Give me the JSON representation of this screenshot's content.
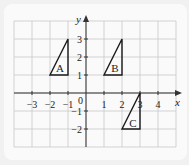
{
  "diagram": {
    "type": "coordinate-grid",
    "axes": {
      "x_label": "x",
      "y_label": "y",
      "origin_label": "0",
      "x_range": [
        -4,
        5
      ],
      "y_range": [
        -3,
        4
      ],
      "x_ticks": [
        {
          "value": -3,
          "label": "−3"
        },
        {
          "value": -2,
          "label": "−2"
        },
        {
          "value": -1,
          "label": "−1"
        },
        {
          "value": 1,
          "label": "1"
        },
        {
          "value": 2,
          "label": "2"
        },
        {
          "value": 3,
          "label": "3"
        },
        {
          "value": 4,
          "label": "4"
        }
      ],
      "y_ticks": [
        {
          "value": 3,
          "label": "3"
        },
        {
          "value": 2,
          "label": "2"
        },
        {
          "value": 1,
          "label": "1"
        },
        {
          "value": -1,
          "label": "−1"
        },
        {
          "value": -2,
          "label": "−2"
        }
      ]
    },
    "shapes": [
      {
        "label": "A",
        "vertices": [
          [
            -2,
            1
          ],
          [
            -1,
            1
          ],
          [
            -1,
            3
          ]
        ],
        "label_at": [
          -1.45,
          1.45
        ]
      },
      {
        "label": "B",
        "vertices": [
          [
            1,
            1
          ],
          [
            2,
            1
          ],
          [
            2,
            3
          ]
        ],
        "label_at": [
          1.6,
          1.45
        ]
      },
      {
        "label": "C",
        "vertices": [
          [
            2,
            -2
          ],
          [
            3,
            -2
          ],
          [
            3,
            0
          ]
        ],
        "label_at": [
          2.6,
          -1.6
        ]
      }
    ],
    "colors": {
      "grid": "#c8c8c8",
      "axis": "#333333",
      "shape": "#1a1a1a",
      "background": "#f1f1f1",
      "panel": "#fafafa"
    }
  }
}
